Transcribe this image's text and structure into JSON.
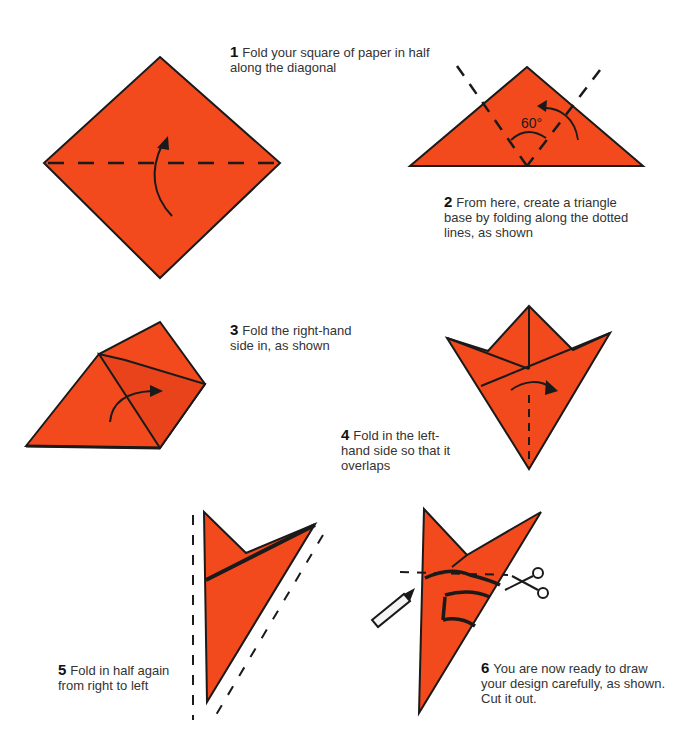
{
  "colors": {
    "paper": "#f24a1c",
    "ink": "#1a1a1a",
    "text": "#333333"
  },
  "steps": [
    {
      "number": "1",
      "text": "Fold your square of paper in half along the diagonal"
    },
    {
      "number": "2",
      "text": "From here, create a triangle base by folding along the dotted lines, as shown"
    },
    {
      "number": "3",
      "text": "Fold the right-hand side in, as shown"
    },
    {
      "number": "4",
      "text": "Fold in the left-hand side so that it overlaps"
    },
    {
      "number": "5",
      "text": "Fold in half again from right to left"
    },
    {
      "number": "6",
      "text": "You are now ready to draw your design carefully, as shown. Cut it out."
    }
  ],
  "annotations": {
    "angle_label": "60°"
  },
  "icons": {
    "step6_tools": [
      "pencil-icon",
      "scissors-icon"
    ]
  }
}
